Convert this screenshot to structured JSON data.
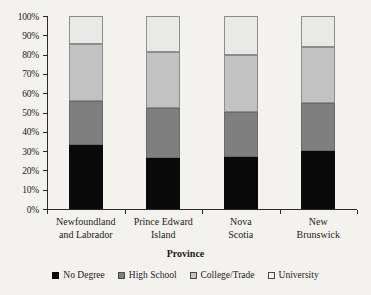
{
  "chart_data": {
    "type": "bar",
    "subtype": "stacked-percentage-column",
    "title": "",
    "xlabel": "Province",
    "ylabel": "",
    "ylim": [
      0,
      100
    ],
    "ytick_labels": [
      "0%",
      "10%",
      "20%",
      "30%",
      "40%",
      "50%",
      "60%",
      "70%",
      "80%",
      "90%",
      "100%"
    ],
    "ytick_values": [
      0,
      10,
      20,
      30,
      40,
      50,
      60,
      70,
      80,
      90,
      100
    ],
    "grid": false,
    "legend_position": "bottom",
    "categories": [
      "Newfoundland and Labrador",
      "Prince Edward Island",
      "Nova Scotia",
      "New Brunswick"
    ],
    "category_lines": [
      [
        "Newfoundland",
        "and Labrador"
      ],
      [
        "Prince Edward",
        "Island"
      ],
      [
        "Nova",
        "Scotia"
      ],
      [
        "New",
        "Brunswick"
      ]
    ],
    "series": [
      {
        "name": "No Degree",
        "color": "#0a0a0a",
        "values": [
          33.0,
          26.5,
          27.0,
          30.0
        ]
      },
      {
        "name": "High School",
        "color": "#7f7f7f",
        "values": [
          23.0,
          26.0,
          23.5,
          25.0
        ]
      },
      {
        "name": "College/Trade",
        "color": "#c2c2c2",
        "values": [
          29.5,
          29.0,
          29.5,
          29.0
        ]
      },
      {
        "name": "University",
        "color": "#e9e9e7",
        "values": [
          14.5,
          18.5,
          20.0,
          16.0
        ]
      }
    ],
    "cumulative_tops": [
      [
        33.0,
        56.0,
        85.5,
        100.0
      ],
      [
        26.5,
        52.5,
        81.5,
        100.0
      ],
      [
        27.0,
        50.5,
        80.0,
        100.0
      ],
      [
        30.0,
        55.0,
        84.0,
        100.0
      ]
    ]
  },
  "legend": {
    "items": [
      {
        "label": "No Degree"
      },
      {
        "label": "High School"
      },
      {
        "label": "College/Trade"
      },
      {
        "label": "University"
      }
    ]
  }
}
